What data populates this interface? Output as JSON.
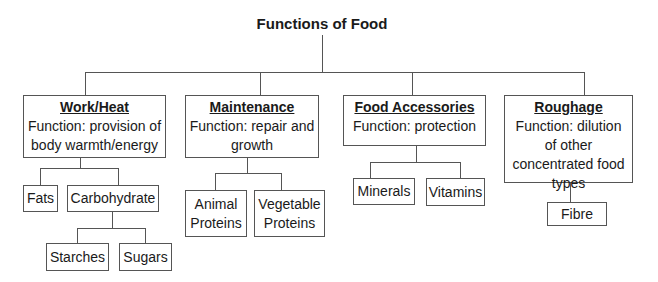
{
  "diagram": {
    "title": "Functions of Food",
    "categories": [
      {
        "heading": "Work/Heat",
        "function": "Function: provision of body warmth/energy",
        "children": [
          {
            "label": "Fats"
          },
          {
            "label": "Carbohydrate",
            "children": [
              {
                "label": "Starches"
              },
              {
                "label": "Sugars"
              }
            ]
          }
        ]
      },
      {
        "heading": "Maintenance",
        "function": "Function: repair and growth",
        "children": [
          {
            "label": "Animal Proteins"
          },
          {
            "label": "Vegetable Proteins"
          }
        ]
      },
      {
        "heading": "Food Accessories",
        "function": "Function: protection",
        "children": [
          {
            "label": "Minerals"
          },
          {
            "label": "Vitamins"
          }
        ]
      },
      {
        "heading": "Roughage",
        "function": "Function: dilution of other concentrated food types",
        "children": [
          {
            "label": "Fibre"
          }
        ]
      }
    ]
  }
}
